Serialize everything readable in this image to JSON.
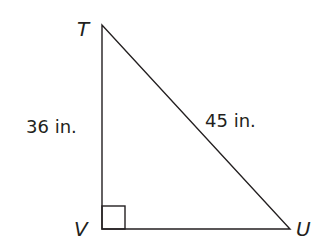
{
  "figure": {
    "type": "right-triangle",
    "stroke_color": "#231f20",
    "background": "#ffffff",
    "vertices": [
      {
        "label": "T",
        "x": 102,
        "y": 25
      },
      {
        "label": "V",
        "x": 102,
        "y": 229
      },
      {
        "label": "U",
        "x": 290,
        "y": 229
      }
    ],
    "right_angle_at": "V",
    "sides": [
      {
        "name": "TV",
        "label": "36 in."
      },
      {
        "name": "TU",
        "label": "45 in."
      }
    ]
  }
}
